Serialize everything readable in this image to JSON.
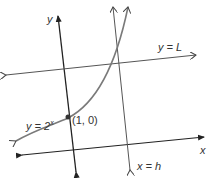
{
  "diagram": {
    "labels": {
      "y_axis": "y",
      "x_axis": "x",
      "horizontal_line": "y = L",
      "vertical_line": "x = h",
      "curve_base": "y = 2",
      "curve_exp": "x",
      "point": "(1, 0)"
    },
    "colors": {
      "axis": "#222222",
      "curve": "#7a7a7a",
      "line": "#555555"
    }
  }
}
